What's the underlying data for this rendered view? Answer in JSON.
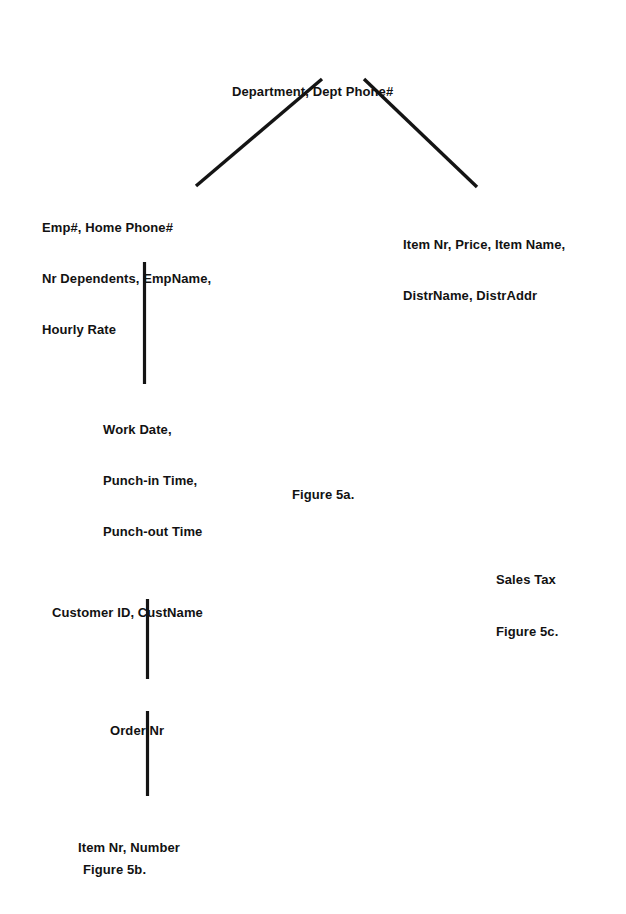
{
  "document": {
    "background_color": "#ffffff",
    "ink_color": "#121212"
  },
  "figures": [
    {
      "id": "figure-5a",
      "caption": "Figure 5a.",
      "nodes": [
        {
          "id": "department-root",
          "lines": [
            "Department, Dept Phone#"
          ]
        },
        {
          "id": "employee-node",
          "lines": [
            "Emp#, Home Phone#",
            "Nr Dependents, EmpName,",
            "Hourly Rate"
          ]
        },
        {
          "id": "item-node",
          "lines": [
            "Item Nr, Price, Item Name,",
            "DistrName, DistrAddr"
          ]
        },
        {
          "id": "timecard-node",
          "lines": [
            "Work Date,",
            "Punch-in Time,",
            "Punch-out Time"
          ]
        }
      ]
    },
    {
      "id": "figure-5b",
      "caption": "Figure 5b.",
      "nodes": [
        {
          "id": "customer-node",
          "lines": [
            "Customer ID, CustName"
          ]
        },
        {
          "id": "order-node",
          "lines": [
            "Order Nr"
          ]
        },
        {
          "id": "lineitem-node",
          "lines": [
            "Item Nr, Number"
          ]
        }
      ]
    },
    {
      "id": "figure-5c",
      "caption": "Figure 5c.",
      "nodes": [
        {
          "id": "sales-tax-node",
          "lines": [
            "Sales Tax"
          ]
        }
      ]
    }
  ],
  "text": {
    "fig5a": {
      "root": "Department, Dept Phone#",
      "employee_l1": "Emp#, Home Phone#",
      "employee_l2": "Nr Dependents, EmpName,",
      "employee_l3": "Hourly Rate",
      "item_l1": "Item Nr, Price, Item Name,",
      "item_l2": "DistrName, DistrAddr",
      "timecard_l1": "Work Date,",
      "timecard_l2": "Punch-in Time,",
      "timecard_l3": "Punch-out Time",
      "caption": "Figure 5a."
    },
    "fig5b": {
      "customer": "Customer ID, CustName",
      "order": "Order Nr",
      "lineitem": "Item Nr, Number",
      "caption": "Figure 5b."
    },
    "fig5c": {
      "sales_tax": "Sales Tax",
      "caption": "Figure 5c."
    }
  }
}
